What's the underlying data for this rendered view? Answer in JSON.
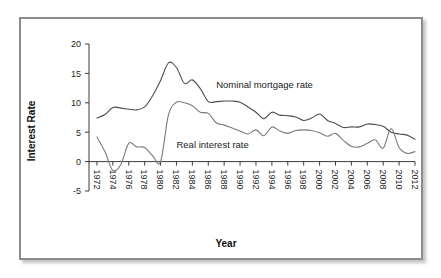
{
  "figure": {
    "frame_color": "#8c8c8c",
    "background": "#ffffff"
  },
  "chart_data": {
    "type": "line",
    "title": "",
    "subtitle": "",
    "xlabel": "Year",
    "ylabel": "Interest Rate",
    "xlim": [
      1971,
      2012
    ],
    "ylim": [
      -5,
      20
    ],
    "grid": false,
    "legend_position": "inline-annotations",
    "y_ticks": [
      -5,
      0,
      5,
      10,
      15,
      20
    ],
    "y_tick_labels": [
      "-5",
      "0",
      "5",
      "10",
      "15",
      "20"
    ],
    "x_ticks": [
      1972,
      1974,
      1976,
      1978,
      1980,
      1982,
      1984,
      1986,
      1988,
      1990,
      1992,
      1994,
      1996,
      1998,
      2000,
      2002,
      2004,
      2006,
      2008,
      2010,
      2012
    ],
    "x_tick_labels": [
      "1972",
      "1974",
      "1976",
      "1978",
      "1980",
      "1982",
      "1984",
      "1986",
      "1988",
      "1990",
      "1992",
      "1994",
      "1996",
      "1998",
      "2000",
      "2002",
      "2004",
      "2006",
      "2008",
      "2010",
      "2012"
    ],
    "x_tick_rotation": 90,
    "annotations": [
      {
        "text": "Nominal mortgage rate",
        "x": 1987.0,
        "y": 12.6,
        "series": "Nominal mortgage rate"
      },
      {
        "text": "Real interest rate",
        "x": 1982.0,
        "y": 2.3,
        "series": "Real interest rate"
      }
    ],
    "x": [
      1972,
      1973,
      1974,
      1975,
      1976,
      1977,
      1978,
      1979,
      1980,
      1981,
      1982,
      1983,
      1984,
      1985,
      1986,
      1987,
      1988,
      1989,
      1990,
      1991,
      1992,
      1993,
      1994,
      1995,
      1996,
      1997,
      1998,
      1999,
      2000,
      2001,
      2002,
      2003,
      2004,
      2005,
      2006,
      2007,
      2008,
      2009,
      2010,
      2011,
      2012
    ],
    "series": [
      {
        "name": "Nominal mortgage rate",
        "color": "#4d4d4d",
        "values": [
          7.4,
          8.0,
          9.2,
          9.1,
          8.9,
          8.8,
          9.3,
          11.2,
          13.8,
          16.8,
          16.0,
          13.3,
          13.9,
          12.4,
          10.2,
          10.2,
          10.3,
          10.3,
          10.1,
          9.3,
          8.4,
          7.3,
          8.4,
          7.9,
          7.8,
          7.6,
          7.0,
          7.4,
          8.1,
          7.0,
          6.5,
          5.8,
          5.9,
          5.9,
          6.4,
          6.3,
          6.0,
          5.0,
          4.7,
          4.5,
          3.8
        ]
      },
      {
        "name": "Real interest rate",
        "color": "#7a7a7a",
        "values": [
          4.2,
          1.7,
          -1.5,
          -0.5,
          3.1,
          2.5,
          2.4,
          1.0,
          0.0,
          8.0,
          10.1,
          10.0,
          9.5,
          8.4,
          8.2,
          6.6,
          6.2,
          5.7,
          5.2,
          4.7,
          5.4,
          4.4,
          5.9,
          5.2,
          4.8,
          5.3,
          5.4,
          5.3,
          4.9,
          4.3,
          4.8,
          3.6,
          2.6,
          2.5,
          3.1,
          3.7,
          2.3,
          5.6,
          2.4,
          1.4,
          1.7
        ]
      }
    ]
  },
  "axes": {
    "y_label": "Interest Rate",
    "x_label": "Year"
  }
}
